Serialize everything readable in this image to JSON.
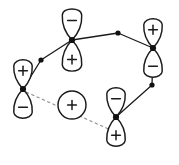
{
  "diagram": {
    "type": "molecular-orbital-phase-diagram",
    "background_color": "#ffffff",
    "stroke_color": "#1a1a1a",
    "dashed_color": "#8d8d8d",
    "canvas": {
      "width": 179,
      "height": 165
    },
    "legend": {
      "plus_symbol": "+",
      "minus_symbol": "−"
    },
    "orbitals": [
      {
        "id": "orbital-top-center",
        "kind": "p-orbital",
        "center_x": 72,
        "center_y": 40,
        "rotation_deg": 0,
        "upper_lobe_sign": "−",
        "lower_lobe_sign": "+",
        "lobe_length": 31,
        "lobe_width": 20
      },
      {
        "id": "orbital-left",
        "kind": "p-orbital",
        "center_x": 23,
        "center_y": 89,
        "rotation_deg": 0,
        "upper_lobe_sign": "+",
        "lower_lobe_sign": "−",
        "lobe_length": 29,
        "lobe_width": 19
      },
      {
        "id": "orbital-right",
        "kind": "p-orbital",
        "center_x": 153,
        "center_y": 48,
        "rotation_deg": 0,
        "upper_lobe_sign": "+",
        "lower_lobe_sign": "−",
        "lobe_length": 29,
        "lobe_width": 19
      },
      {
        "id": "orbital-bottom-right",
        "kind": "p-orbital",
        "center_x": 116,
        "center_y": 117,
        "rotation_deg": 0,
        "upper_lobe_sign": "−",
        "lower_lobe_sign": "+",
        "lobe_length": 29,
        "lobe_width": 19
      }
    ],
    "circles": [
      {
        "id": "circle-center",
        "center_x": 72,
        "center_y": 105,
        "radius": 14,
        "sign": "+"
      }
    ],
    "vertices": [
      {
        "id": "vertex-left-mid",
        "x": 41,
        "y": 60,
        "radius": 2.6
      },
      {
        "id": "vertex-top-right",
        "x": 118,
        "y": 33,
        "radius": 2.6
      },
      {
        "id": "vertex-right-lower",
        "x": 152,
        "y": 85,
        "radius": 2.6
      },
      {
        "id": "vertex-orbital-top-center",
        "x": 72,
        "y": 40,
        "radius": 3.1
      },
      {
        "id": "vertex-orbital-left",
        "x": 23,
        "y": 89,
        "radius": 3.1
      },
      {
        "id": "vertex-orbital-right",
        "x": 153,
        "y": 48,
        "radius": 3.1
      },
      {
        "id": "vertex-orbital-bottom-right",
        "x": 116,
        "y": 117,
        "radius": 3.1
      }
    ],
    "bonds_solid": [
      {
        "id": "bond-left-to-mid",
        "x1": 23,
        "y1": 89,
        "x2": 41,
        "y2": 60
      },
      {
        "id": "bond-mid-to-topcenter",
        "x1": 41,
        "y1": 60,
        "x2": 72,
        "y2": 40
      },
      {
        "id": "bond-topcenter-to-vertex",
        "x1": 72,
        "y1": 40,
        "x2": 118,
        "y2": 33
      },
      {
        "id": "bond-vertex-to-right",
        "x1": 118,
        "y1": 33,
        "x2": 153,
        "y2": 48
      },
      {
        "id": "bond-right-to-lower",
        "x1": 153,
        "y1": 48,
        "x2": 152,
        "y2": 85
      },
      {
        "id": "bond-lower-to-bottomright",
        "x1": 152,
        "y1": 85,
        "x2": 116,
        "y2": 117
      }
    ],
    "bonds_dashed": [
      {
        "id": "dashed-left-to-bottomright",
        "x1": 26,
        "y1": 92,
        "x2": 113,
        "y2": 131
      }
    ]
  }
}
